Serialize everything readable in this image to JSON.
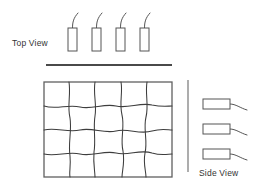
{
  "diagram": {
    "canvas": {
      "width": 261,
      "height": 191,
      "background": "#ffffff"
    },
    "stroke_color": "#555555",
    "mesh_color": "#3d3d3d",
    "rule_color": "#4a4a4a",
    "labels": {
      "top_view": "Top View",
      "side_view": "Side View"
    },
    "top_view": {
      "label_x": 12,
      "label_y": 46,
      "probe_count": 4,
      "probes": [
        {
          "x": 68,
          "y": 28,
          "w": 9,
          "h": 23,
          "wire": "M 72.5 28 C 72.5 22, 73.5 18, 78 13"
        },
        {
          "x": 92,
          "y": 28,
          "w": 9,
          "h": 23,
          "wire": "M 96.5 28 C 96.5 22, 97.5 18, 102 13"
        },
        {
          "x": 116,
          "y": 28,
          "w": 9,
          "h": 23,
          "wire": "M 120.5 28 C 120.5 22, 121.5 18, 126 13"
        },
        {
          "x": 140,
          "y": 28,
          "w": 9,
          "h": 23,
          "wire": "M 144.5 28 C 144.5 22, 145.5 18, 150 13"
        }
      ],
      "baseline": {
        "x1": 46,
        "y1": 65,
        "x2": 172,
        "y2": 65
      }
    },
    "mesh": {
      "x": 44,
      "y": 82,
      "width": 128,
      "height": 95,
      "columns": 5,
      "rows": 4,
      "description": "distorted quadrilateral mesh grid",
      "vertical_paths": [
        "M 69 82 C 71 95, 67 106, 70 118 C 72 130, 68 143, 70 156 C 71 166, 69 172, 70 177",
        "M 95 82 C 93 94, 97 104, 95 116 C 93 128, 96 140, 94 152 C 93 164, 95 171, 95 177",
        "M 121 82 C 123 93, 119 103, 122 115 C 125 127, 120 139, 123 151 C 125 163, 122 171, 122 177",
        "M 147 82 C 145 94, 149 105, 146 117 C 143 129, 148 141, 145 153 C 143 164, 146 171, 146 177"
      ],
      "horizontal_paths": [
        "M 44 106 C 56 110, 68 104, 80 107 C 92 110, 104 103, 116 106 C 128 109, 140 102, 152 105 C 162 107, 168 106, 172 106",
        "M 44 130 C 56 127, 68 133, 80 130 C 92 127, 104 134, 116 131 C 128 128, 140 135, 152 131 C 162 128, 168 130, 172 130",
        "M 44 154 C 56 157, 68 151, 80 154 C 92 157, 104 150, 116 153 C 128 156, 140 149, 152 153 C 162 156, 168 154, 172 154"
      ]
    },
    "side_view": {
      "label_x": 199,
      "label_y": 176,
      "rail": {
        "x1": 188,
        "y1": 80,
        "x2": 188,
        "y2": 172
      },
      "probe_count": 3,
      "probes": [
        {
          "x": 203,
          "y": 99,
          "w": 27,
          "h": 10,
          "wire": "M 230 104 C 236 104, 240 108, 247 110"
        },
        {
          "x": 203,
          "y": 124,
          "w": 27,
          "h": 10,
          "wire": "M 230 129 C 236 129, 240 133, 247 135"
        },
        {
          "x": 203,
          "y": 149,
          "w": 27,
          "h": 10,
          "wire": "M 230 154 C 236 154, 240 158, 247 160"
        }
      ]
    }
  }
}
